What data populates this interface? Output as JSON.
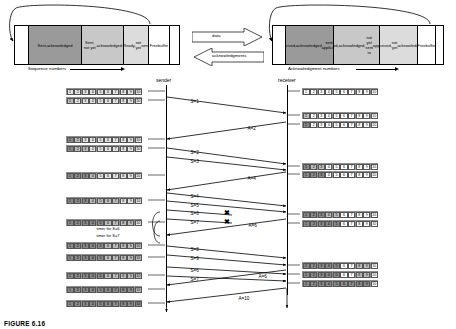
{
  "figure": {
    "caption": "FIGURE 6.16"
  },
  "sender_buffer": {
    "axis_label": "Sequence numbers",
    "segments": [
      {
        "label": "",
        "shade": "white"
      },
      {
        "label": "Sent,\nacknowledged",
        "shade": "dark"
      },
      {
        "label": "Sent, not yet\nacknowledged",
        "shade": "mid"
      },
      {
        "label": "Ready,\nnot yet\nsent",
        "shade": "light"
      },
      {
        "label": "Free\nbuffer",
        "shade": "white"
      },
      {
        "label": "",
        "shade": "white"
      }
    ]
  },
  "receiver_buffer": {
    "axis_label": "Acknowledgment numbers",
    "segments": [
      {
        "label": "",
        "shade": "white"
      },
      {
        "label": "Received,\nacknowledged\nsent to application",
        "shade": "dark"
      },
      {
        "label": "Received,\nacknowledged,\nnot yet sent to\napplication",
        "shade": "mid"
      },
      {
        "label": "Received,\nnot yet\nacknowledged",
        "shade": "light"
      },
      {
        "label": "Free\nbuffer",
        "shade": "white"
      },
      {
        "label": "",
        "shade": "white"
      }
    ]
  },
  "channel": {
    "data_label": "data",
    "ack_label": "acknowledgments"
  },
  "sequence": {
    "sender_label": "sender",
    "receiver_label": "receiver",
    "messages": [
      {
        "id": "m1",
        "label": "S=1",
        "dir": "right"
      },
      {
        "id": "m2",
        "label": "A=2",
        "dir": "left"
      },
      {
        "id": "m3",
        "label": "S=2",
        "dir": "right"
      },
      {
        "id": "m4",
        "label": "S=3",
        "dir": "right"
      },
      {
        "id": "m5",
        "label": "A=4",
        "dir": "left"
      },
      {
        "id": "m6",
        "label": "S=4",
        "dir": "right"
      },
      {
        "id": "m7",
        "label": "S=5",
        "dir": "right"
      },
      {
        "id": "m8",
        "label": "S=6",
        "dir": "right",
        "lost": true
      },
      {
        "id": "m9",
        "label": "S=7",
        "dir": "right",
        "lost": true
      },
      {
        "id": "m10",
        "label": "A=6",
        "dir": "left"
      },
      {
        "id": "m11",
        "label": "S=8",
        "dir": "right"
      },
      {
        "id": "m12",
        "label": "S=9",
        "dir": "right"
      },
      {
        "id": "m13",
        "label": "S=6",
        "dir": "right"
      },
      {
        "id": "m14",
        "label": "S=7",
        "dir": "right"
      },
      {
        "id": "m15",
        "label": "A=6",
        "dir": "left"
      },
      {
        "id": "m16",
        "label": "A=10",
        "dir": "left"
      }
    ],
    "timers": [
      {
        "label": "timer for S=6"
      },
      {
        "label": "timer for S=7"
      }
    ],
    "lost_marker": "✖"
  },
  "strips": {
    "cell_labels": [
      "1",
      "2",
      "3",
      "4",
      "5",
      "6",
      "7",
      "8",
      "9",
      "10"
    ],
    "sender": [
      {
        "y": 88,
        "states": [
          "s3",
          "s3",
          "s3",
          "s3",
          "s3",
          "s3",
          "s3",
          "s3",
          "s3",
          "s3"
        ]
      },
      {
        "y": 97,
        "states": [
          "s1",
          "s3",
          "s3",
          "s3",
          "s3",
          "s3",
          "s3",
          "s3",
          "s3",
          "s3"
        ]
      },
      {
        "y": 136,
        "states": [
          "s2",
          "s1",
          "s3",
          "s3",
          "s3",
          "s3",
          "s3",
          "s3",
          "s3",
          "s3"
        ]
      },
      {
        "y": 145,
        "states": [
          "s2",
          "s1",
          "s1",
          "s3",
          "s3",
          "s3",
          "s3",
          "s3",
          "s3",
          "s3"
        ]
      },
      {
        "y": 172,
        "states": [
          "s2",
          "s2",
          "s2",
          "s1",
          "s3",
          "s3",
          "s3",
          "s3",
          "s3",
          "s3"
        ]
      },
      {
        "y": 197,
        "states": [
          "s2",
          "s2",
          "s2",
          "s1",
          "s1",
          "s1",
          "s1",
          "s3",
          "s3",
          "s3"
        ]
      },
      {
        "y": 219,
        "states": [
          "s2",
          "s2",
          "s2",
          "s2",
          "s2",
          "s1",
          "s1",
          "s1",
          "s1",
          "s3"
        ]
      },
      {
        "y": 242,
        "states": [
          "s2",
          "s2",
          "s2",
          "s2",
          "s2",
          "s1",
          "s1",
          "s1",
          "s1",
          "s1"
        ]
      },
      {
        "y": 254,
        "states": [
          "s2",
          "s2",
          "s2",
          "s2",
          "s2",
          "s1",
          "s1",
          "s1",
          "s1",
          "s1"
        ]
      },
      {
        "y": 272,
        "states": [
          "s2",
          "s2",
          "s2",
          "s2",
          "s2",
          "s1",
          "s1",
          "s1",
          "s1",
          "s1"
        ]
      },
      {
        "y": 286,
        "states": [
          "s2",
          "s2",
          "s2",
          "s2",
          "s2",
          "s2",
          "s2",
          "s2",
          "s2",
          "s1"
        ]
      },
      {
        "y": 300,
        "states": [
          "s2",
          "s2",
          "s2",
          "s2",
          "s2",
          "s2",
          "s2",
          "s2",
          "s2",
          "s2"
        ]
      }
    ],
    "receiver": [
      {
        "y": 88,
        "states": [
          "s0",
          "s0",
          "s0",
          "s0",
          "s0",
          "s0",
          "s0",
          "s0",
          "s0",
          "s0"
        ]
      },
      {
        "y": 112,
        "states": [
          "s1",
          "s0",
          "s0",
          "s0",
          "s0",
          "s0",
          "s0",
          "s0",
          "s0",
          "s0"
        ]
      },
      {
        "y": 121,
        "states": [
          "s2",
          "s0",
          "s0",
          "s0",
          "s0",
          "s0",
          "s0",
          "s0",
          "s0",
          "s0"
        ]
      },
      {
        "y": 163,
        "states": [
          "s2",
          "s1",
          "s1",
          "s0",
          "s0",
          "s0",
          "s0",
          "s0",
          "s0",
          "s0"
        ]
      },
      {
        "y": 171,
        "states": [
          "s2",
          "s2",
          "s2",
          "s0",
          "s0",
          "s0",
          "s0",
          "s0",
          "s0",
          "s0"
        ]
      },
      {
        "y": 211,
        "states": [
          "s2",
          "s2",
          "s2",
          "s1",
          "s1",
          "s0",
          "s0",
          "s0",
          "s0",
          "s0"
        ]
      },
      {
        "y": 220,
        "states": [
          "s2",
          "s2",
          "s2",
          "s2",
          "s2",
          "s0",
          "s0",
          "s0",
          "s0",
          "s0"
        ]
      },
      {
        "y": 262,
        "states": [
          "s2",
          "s2",
          "s2",
          "s2",
          "s2",
          "s0",
          "s0",
          "s1",
          "s1",
          "s0"
        ]
      },
      {
        "y": 271,
        "states": [
          "s2",
          "s2",
          "s2",
          "s2",
          "s2",
          "s0",
          "s0",
          "s1",
          "s1",
          "s0"
        ]
      },
      {
        "y": 280,
        "states": [
          "s2",
          "s2",
          "s2",
          "s2",
          "s2",
          "s2",
          "s2",
          "s2",
          "s2",
          "s0"
        ]
      }
    ]
  }
}
